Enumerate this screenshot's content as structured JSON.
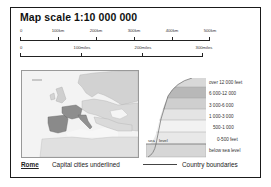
{
  "legend": {
    "title": "Map scale 1:10 000 000",
    "km_scale": {
      "ticks": [
        "0",
        "100km",
        "200km",
        "300km",
        "400km",
        "500km"
      ]
    },
    "miles_scale": {
      "ticks": [
        "0",
        "100miles",
        "200miles",
        "300miles"
      ]
    },
    "locator_map": {
      "region": "Europe",
      "highlighted": "Iberia, France, Italy (shaded dark)"
    },
    "elevation": {
      "bands": [
        {
          "label": "over 12 000 feet",
          "color": "#d8d8d8"
        },
        {
          "label": "6 000-12 000",
          "color": "#b8b8b8"
        },
        {
          "label": "3 000-6 000",
          "color": "#cfcfcf"
        },
        {
          "label": "1 000-3 000",
          "color": "#e4e4e4"
        },
        {
          "label": "500-1 000",
          "color": "#f2f2f2"
        },
        {
          "label": "0-500 feet",
          "color": "#e8e8e8"
        },
        {
          "label": "below sea level",
          "color": "#d6d6d6"
        }
      ],
      "sea_label": "sea",
      "level_label": "level"
    },
    "footer": {
      "capital_example": "Rome",
      "capital_text": "Capital cities underlined",
      "boundary_text": "Country boundaries"
    }
  }
}
